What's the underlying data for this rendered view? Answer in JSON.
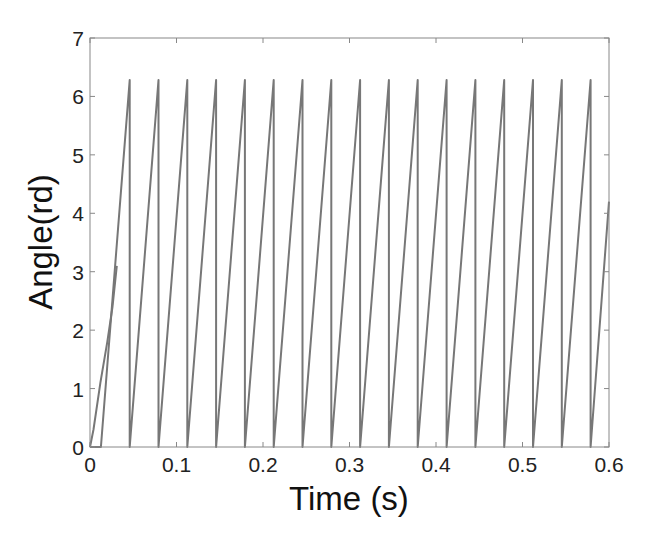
{
  "chart_data": {
    "type": "line",
    "title": "",
    "xlabel": "Time (s)",
    "ylabel": "Angle(rd)",
    "xlim": [
      0,
      0.6
    ],
    "ylim": [
      0,
      7
    ],
    "xticks": [
      0,
      0.1,
      0.2,
      0.3,
      0.4,
      0.5,
      0.6
    ],
    "xtick_labels": [
      "0",
      "0.1",
      "0.2",
      "0.3",
      "0.4",
      "0.5",
      "0.6"
    ],
    "yticks": [
      0,
      1,
      2,
      3,
      4,
      5,
      6,
      7
    ],
    "ytick_labels": [
      "0",
      "1",
      "2",
      "3",
      "4",
      "5",
      "6",
      "7"
    ],
    "grid": false,
    "legend": null,
    "line_color": "#777777",
    "series": [
      {
        "name": "angle (sawtooth, wraps at 2π)",
        "description": "Rotor angle rising linearly from 0 to 6.28 rad then resetting to 0; period ≈ 0.0333 s",
        "x": [
          0,
          0.0126,
          0.0126,
          0.0459,
          0.0459,
          0.0792,
          0.0792,
          0.1125,
          0.1125,
          0.1458,
          0.1458,
          0.1791,
          0.1791,
          0.2124,
          0.2124,
          0.2457,
          0.2457,
          0.279,
          0.279,
          0.3123,
          0.3123,
          0.3456,
          0.3456,
          0.3789,
          0.3789,
          0.4122,
          0.4122,
          0.4455,
          0.4455,
          0.4788,
          0.4788,
          0.5121,
          0.5121,
          0.5454,
          0.5454,
          0.5787,
          0.5787,
          0.6
        ],
        "y": [
          0,
          0,
          0,
          6.28,
          0,
          6.28,
          0,
          6.28,
          0,
          6.28,
          0,
          6.28,
          0,
          6.28,
          0,
          6.28,
          0,
          6.28,
          0,
          6.28,
          0,
          6.28,
          0,
          6.28,
          0,
          6.28,
          0,
          6.28,
          0,
          6.28,
          0,
          6.28,
          0,
          6.28,
          0,
          6.28,
          0,
          4.2
        ]
      },
      {
        "name": "initial transient",
        "description": "Start-up trace rising from origin, joining the first ramp around 3 rad",
        "x": [
          0,
          0.004,
          0.012,
          0.02,
          0.026,
          0.031
        ],
        "y": [
          0,
          0.3,
          1.1,
          1.8,
          2.4,
          3.1
        ]
      }
    ],
    "peak_value": 6.28,
    "final_value": 4.2
  },
  "axes": {
    "x_label": "Time (s)",
    "y_label": "Angle(rd)"
  }
}
